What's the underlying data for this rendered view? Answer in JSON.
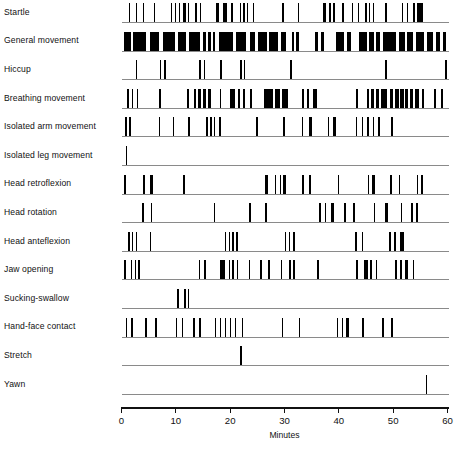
{
  "chart_data": {
    "type": "raster",
    "title": "",
    "xlabel": "Minutes",
    "ylabel": "",
    "xlim": [
      0,
      60
    ],
    "xticks": [
      0,
      10,
      20,
      30,
      40,
      50,
      60
    ],
    "xticklabels": [
      "0",
      "10",
      "20",
      "30",
      "40",
      "50",
      "60"
    ],
    "grid": false,
    "legend": "none",
    "bar_color": "#000000",
    "baseline_color": "#8a8a8a",
    "axis_color": "#111111",
    "categories": [
      "Startle",
      "General movement",
      "Hiccup",
      "Breathing movement",
      "Isolated arm movement",
      "Isolated leg movement",
      "Head retroflexion",
      "Head rotation",
      "Head anteflexion",
      "Jaw opening",
      "Sucking-swallow",
      "Hand-face contact",
      "Stretch",
      "Yawn"
    ],
    "series": [
      {
        "name": "Startle",
        "events": [
          [
            1.3,
            0.22
          ],
          [
            2.6,
            0.22
          ],
          [
            4.0,
            0.22
          ],
          [
            6.0,
            0.24
          ],
          [
            9.1,
            0.26
          ],
          [
            9.8,
            0.3
          ],
          [
            10.5,
            0.26
          ],
          [
            11.3,
            0.5
          ],
          [
            12.2,
            0.28
          ],
          [
            13.6,
            0.3
          ],
          [
            14.4,
            0.3
          ],
          [
            17.4,
            0.5
          ],
          [
            18.6,
            0.9
          ],
          [
            20.1,
            0.4
          ],
          [
            21.8,
            0.26
          ],
          [
            22.4,
            0.26
          ],
          [
            23.1,
            0.26
          ],
          [
            24.2,
            0.24
          ],
          [
            29.6,
            0.28
          ],
          [
            32.4,
            0.3
          ],
          [
            37.0,
            0.7
          ],
          [
            38.2,
            0.4
          ],
          [
            38.9,
            0.4
          ],
          [
            40.6,
            0.3
          ],
          [
            42.4,
            0.26
          ],
          [
            43.5,
            0.26
          ],
          [
            44.8,
            0.3
          ],
          [
            45.5,
            0.3
          ],
          [
            46.2,
            0.3
          ],
          [
            48.5,
            0.4
          ],
          [
            51.6,
            0.3
          ],
          [
            52.5,
            0.3
          ],
          [
            53.6,
            0.4
          ],
          [
            54.4,
            1.1
          ]
        ]
      },
      {
        "name": "General movement",
        "events": [
          [
            0.4,
            1.3
          ],
          [
            2.1,
            2.4
          ],
          [
            5.2,
            1.7
          ],
          [
            7.6,
            2.2
          ],
          [
            10.4,
            1.5
          ],
          [
            12.4,
            2.0
          ],
          [
            15.0,
            0.5
          ],
          [
            15.9,
            0.6
          ],
          [
            16.8,
            0.5
          ],
          [
            17.9,
            2.6
          ],
          [
            21.0,
            2.0
          ],
          [
            23.7,
            0.9
          ],
          [
            25.2,
            1.5
          ],
          [
            27.2,
            1.6
          ],
          [
            29.4,
            0.9
          ],
          [
            31.4,
            0.4
          ],
          [
            32.2,
            0.5
          ],
          [
            35.7,
            0.5
          ],
          [
            36.7,
            0.5
          ],
          [
            39.5,
            1.4
          ],
          [
            41.5,
            0.7
          ],
          [
            43.8,
            1.3
          ],
          [
            45.5,
            0.9
          ],
          [
            46.9,
            0.7
          ],
          [
            48.2,
            2.3
          ],
          [
            51.0,
            1.2
          ],
          [
            52.5,
            1.2
          ],
          [
            54.2,
            1.5
          ],
          [
            56.2,
            1.1
          ],
          [
            57.8,
            0.9
          ],
          [
            59.2,
            0.5
          ]
        ]
      },
      {
        "name": "Hiccup",
        "events": [
          [
            2.6,
            0.26
          ],
          [
            7.0,
            0.26
          ],
          [
            7.8,
            0.3
          ],
          [
            14.3,
            0.3
          ],
          [
            15.1,
            0.3
          ],
          [
            18.2,
            0.3
          ],
          [
            21.9,
            0.26
          ],
          [
            22.5,
            0.26
          ],
          [
            31.0,
            0.3
          ],
          [
            48.5,
            0.3
          ],
          [
            59.6,
            0.3
          ]
        ]
      },
      {
        "name": "Breathing movement",
        "events": [
          [
            1.0,
            0.3
          ],
          [
            1.9,
            0.3
          ],
          [
            2.8,
            0.3
          ],
          [
            6.9,
            0.3
          ],
          [
            12.1,
            0.3
          ],
          [
            13.4,
            0.3
          ],
          [
            14.1,
            0.5
          ],
          [
            15.0,
            0.5
          ],
          [
            16.0,
            0.4
          ],
          [
            18.1,
            0.3
          ],
          [
            20.0,
            0.9
          ],
          [
            21.4,
            0.5
          ],
          [
            22.3,
            0.4
          ],
          [
            23.6,
            0.4
          ],
          [
            26.3,
            1.5
          ],
          [
            28.3,
            0.9
          ],
          [
            29.6,
            1.0
          ],
          [
            33.2,
            0.4
          ],
          [
            34.1,
            0.4
          ],
          [
            35.3,
            0.6
          ],
          [
            43.1,
            0.4
          ],
          [
            45.2,
            0.4
          ],
          [
            46.0,
            0.5
          ],
          [
            46.9,
            0.5
          ],
          [
            47.7,
            1.2
          ],
          [
            49.4,
            0.6
          ],
          [
            50.3,
            0.7
          ],
          [
            51.3,
            0.7
          ],
          [
            52.2,
            0.6
          ],
          [
            53.1,
            0.5
          ],
          [
            54.0,
            0.7
          ],
          [
            55.3,
            0.4
          ],
          [
            57.5,
            0.3
          ],
          [
            58.8,
            0.3
          ]
        ]
      },
      {
        "name": "Isolated arm movement",
        "events": [
          [
            0.7,
            0.26
          ],
          [
            1.4,
            0.26
          ],
          [
            6.9,
            0.26
          ],
          [
            9.4,
            0.26
          ],
          [
            12.3,
            0.26
          ],
          [
            15.6,
            0.28
          ],
          [
            16.3,
            0.28
          ],
          [
            17.0,
            0.28
          ],
          [
            18.0,
            0.3
          ],
          [
            24.7,
            0.4
          ],
          [
            29.8,
            0.26
          ],
          [
            33.2,
            0.28
          ],
          [
            34.5,
            0.5
          ],
          [
            38.0,
            0.28
          ],
          [
            38.9,
            0.6
          ],
          [
            43.1,
            0.3
          ],
          [
            44.2,
            0.3
          ],
          [
            45.2,
            0.3
          ],
          [
            46.2,
            0.3
          ],
          [
            47.3,
            0.3
          ],
          [
            49.6,
            0.3
          ]
        ]
      },
      {
        "name": "Isolated leg movement",
        "events": [
          [
            0.8,
            0.3
          ]
        ]
      },
      {
        "name": "Head retroflexion",
        "events": [
          [
            0.5,
            0.26
          ],
          [
            4.0,
            0.3
          ],
          [
            5.2,
            0.6
          ],
          [
            11.4,
            0.26
          ],
          [
            26.4,
            0.6
          ],
          [
            28.2,
            0.3
          ],
          [
            29.1,
            0.3
          ],
          [
            29.8,
            0.5
          ],
          [
            33.2,
            0.3
          ],
          [
            34.5,
            0.3
          ],
          [
            39.8,
            0.3
          ],
          [
            45.3,
            0.3
          ],
          [
            46.1,
            0.5
          ],
          [
            49.5,
            0.3
          ],
          [
            51.0,
            0.3
          ],
          [
            54.3,
            0.3
          ],
          [
            55.2,
            0.3
          ]
        ]
      },
      {
        "name": "Head rotation",
        "events": [
          [
            3.8,
            0.28
          ],
          [
            5.4,
            0.28
          ],
          [
            17.0,
            0.26
          ],
          [
            23.5,
            0.28
          ],
          [
            26.5,
            0.28
          ],
          [
            36.4,
            0.3
          ],
          [
            37.4,
            0.3
          ],
          [
            38.5,
            0.55
          ],
          [
            41.0,
            0.3
          ],
          [
            42.6,
            0.3
          ],
          [
            46.4,
            0.3
          ],
          [
            48.5,
            0.5
          ],
          [
            51.4,
            0.3
          ],
          [
            53.3,
            0.3
          ],
          [
            54.2,
            0.3
          ]
        ]
      },
      {
        "name": "Head anteflexion",
        "events": [
          [
            1.2,
            0.3
          ],
          [
            1.9,
            0.3
          ],
          [
            2.6,
            0.3
          ],
          [
            5.2,
            0.3
          ],
          [
            19.0,
            0.3
          ],
          [
            19.7,
            0.3
          ],
          [
            20.4,
            0.3
          ],
          [
            21.1,
            0.3
          ],
          [
            30.0,
            0.3
          ],
          [
            30.8,
            0.3
          ],
          [
            31.6,
            0.3
          ],
          [
            43.0,
            0.3
          ],
          [
            44.2,
            0.3
          ],
          [
            49.3,
            0.3
          ],
          [
            50.2,
            0.3
          ],
          [
            51.2,
            0.8
          ]
        ]
      },
      {
        "name": "Jaw opening",
        "events": [
          [
            0.5,
            0.3
          ],
          [
            1.7,
            0.3
          ],
          [
            2.4,
            0.3
          ],
          [
            3.1,
            0.3
          ],
          [
            14.2,
            0.3
          ],
          [
            15.2,
            0.3
          ],
          [
            18.1,
            0.9
          ],
          [
            19.7,
            0.3
          ],
          [
            20.4,
            0.3
          ],
          [
            21.2,
            0.3
          ],
          [
            23.4,
            0.3
          ],
          [
            25.5,
            0.3
          ],
          [
            27.0,
            0.3
          ],
          [
            29.3,
            0.3
          ],
          [
            30.9,
            0.3
          ],
          [
            31.6,
            0.3
          ],
          [
            36.0,
            0.3
          ],
          [
            43.2,
            0.3
          ],
          [
            44.6,
            0.8
          ],
          [
            45.8,
            0.3
          ],
          [
            46.8,
            0.3
          ],
          [
            50.4,
            0.3
          ],
          [
            51.3,
            0.3
          ],
          [
            52.2,
            0.5
          ],
          [
            53.6,
            0.3
          ]
        ]
      },
      {
        "name": "Sucking-swallow",
        "events": [
          [
            10.2,
            0.3
          ],
          [
            11.5,
            0.3
          ],
          [
            12.2,
            0.3
          ]
        ]
      },
      {
        "name": "Hand-face contact",
        "events": [
          [
            0.8,
            0.26
          ],
          [
            1.8,
            0.26
          ],
          [
            4.4,
            0.26
          ],
          [
            6.2,
            0.26
          ],
          [
            10.0,
            0.26
          ],
          [
            11.1,
            0.26
          ],
          [
            13.2,
            0.26
          ],
          [
            14.3,
            0.26
          ],
          [
            17.2,
            0.26
          ],
          [
            18.1,
            0.26
          ],
          [
            19.0,
            0.26
          ],
          [
            19.9,
            0.26
          ],
          [
            20.8,
            0.26
          ],
          [
            22.1,
            0.35
          ],
          [
            29.5,
            0.3
          ],
          [
            32.6,
            0.26
          ],
          [
            39.6,
            0.28
          ],
          [
            40.5,
            0.28
          ],
          [
            41.4,
            0.5
          ],
          [
            44.3,
            0.35
          ],
          [
            48.0,
            0.28
          ],
          [
            49.6,
            0.28
          ]
        ]
      },
      {
        "name": "Stretch",
        "events": [
          [
            21.8,
            0.3
          ]
        ]
      },
      {
        "name": "Yawn",
        "events": [
          [
            56.0,
            0.3
          ]
        ]
      }
    ]
  }
}
